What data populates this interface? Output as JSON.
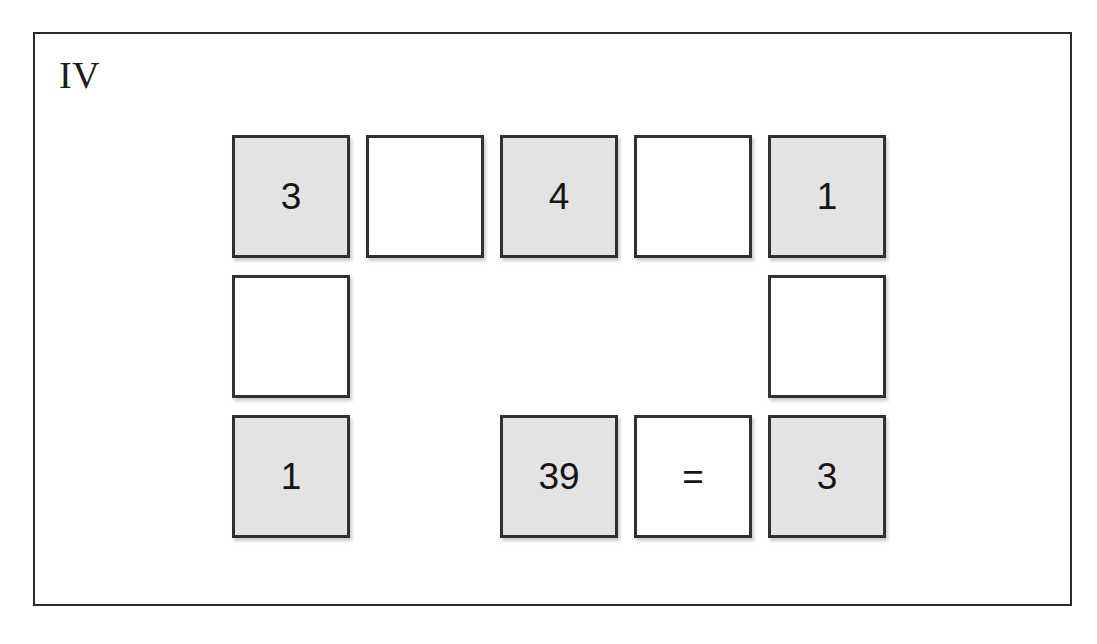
{
  "panel": {
    "label": "IV"
  },
  "colors": {
    "frame_border": "#2b2b2b",
    "tile_border": "#303030",
    "tile_filled_background": "#e3e3e3",
    "tile_blank_background": "#ffffff",
    "text": "#161616",
    "page_background": "#ffffff"
  },
  "grid": {
    "rows": 3,
    "columns": 5,
    "tile_width": 118,
    "tile_height": 123,
    "column_gap": 16,
    "row_gap": 17
  },
  "tiles": [
    {
      "row": 1,
      "col": 1,
      "value": "3",
      "state": "filled",
      "present": true
    },
    {
      "row": 1,
      "col": 2,
      "value": "",
      "state": "blank",
      "present": true
    },
    {
      "row": 1,
      "col": 3,
      "value": "4",
      "state": "filled",
      "present": true
    },
    {
      "row": 1,
      "col": 4,
      "value": "",
      "state": "blank",
      "present": true
    },
    {
      "row": 1,
      "col": 5,
      "value": "1",
      "state": "filled",
      "present": true
    },
    {
      "row": 2,
      "col": 1,
      "value": "",
      "state": "blank",
      "present": true
    },
    {
      "row": 2,
      "col": 2,
      "value": "",
      "state": "empty",
      "present": false
    },
    {
      "row": 2,
      "col": 3,
      "value": "",
      "state": "empty",
      "present": false
    },
    {
      "row": 2,
      "col": 4,
      "value": "",
      "state": "empty",
      "present": false
    },
    {
      "row": 2,
      "col": 5,
      "value": "",
      "state": "blank",
      "present": true
    },
    {
      "row": 3,
      "col": 1,
      "value": "1",
      "state": "filled",
      "present": true
    },
    {
      "row": 3,
      "col": 2,
      "value": "",
      "state": "empty",
      "present": false
    },
    {
      "row": 3,
      "col": 3,
      "value": "39",
      "state": "filled",
      "present": true
    },
    {
      "row": 3,
      "col": 4,
      "value": "=",
      "state": "blank",
      "present": true
    },
    {
      "row": 3,
      "col": 5,
      "value": "3",
      "state": "filled",
      "present": true
    }
  ]
}
